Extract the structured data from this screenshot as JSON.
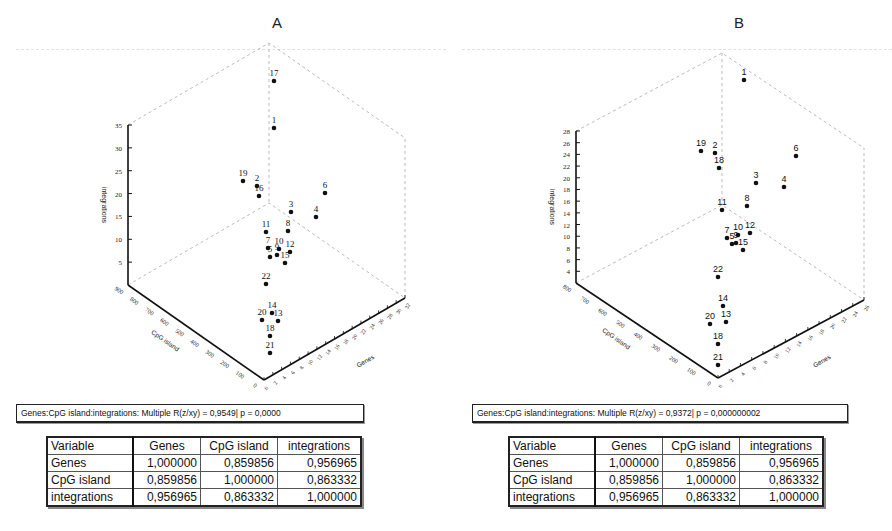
{
  "chart_data": [
    {
      "type": "scatter3d",
      "title": "A",
      "xlabel": "Genes",
      "ylabel": "CpG island",
      "zlabel": "integrations",
      "x_ticks": [
        "0",
        "2",
        "4",
        "6",
        "8",
        "10",
        "12",
        "14",
        "16",
        "18",
        "20",
        "22",
        "24",
        "26",
        "28",
        "30",
        "32"
      ],
      "y_ticks": [
        "0",
        "100",
        "200",
        "300",
        "400",
        "500",
        "600",
        "700",
        "800",
        "900"
      ],
      "z_ticks": [
        "5",
        "10",
        "15",
        "20",
        "25",
        "30",
        "35"
      ],
      "zlim": [
        0,
        35
      ],
      "points": [
        {
          "label": "17",
          "sx": 274,
          "sy": 81
        },
        {
          "label": "1",
          "sx": 274,
          "sy": 128
        },
        {
          "label": "19",
          "sx": 243,
          "sy": 181
        },
        {
          "label": "2",
          "sx": 257,
          "sy": 186
        },
        {
          "label": "16",
          "sx": 259,
          "sy": 196
        },
        {
          "label": "6",
          "sx": 325,
          "sy": 193
        },
        {
          "label": "3",
          "sx": 291,
          "sy": 212
        },
        {
          "label": "4",
          "sx": 316,
          "sy": 217
        },
        {
          "label": "11",
          "sx": 266,
          "sy": 232
        },
        {
          "label": "8",
          "sx": 288,
          "sy": 231
        },
        {
          "label": "7",
          "sx": 268,
          "sy": 248
        },
        {
          "label": "10",
          "sx": 279,
          "sy": 249
        },
        {
          "label": "12",
          "sx": 290,
          "sy": 252
        },
        {
          "label": "5",
          "sx": 270,
          "sy": 257
        },
        {
          "label": "9",
          "sx": 277,
          "sy": 255
        },
        {
          "label": "15",
          "sx": 285,
          "sy": 263
        },
        {
          "label": "22",
          "sx": 266,
          "sy": 284
        },
        {
          "label": "14",
          "sx": 272,
          "sy": 313
        },
        {
          "label": "20",
          "sx": 262,
          "sy": 320
        },
        {
          "label": "13",
          "sx": 278,
          "sy": 321
        },
        {
          "label": "18",
          "sx": 270,
          "sy": 336
        },
        {
          "label": "21",
          "sx": 270,
          "sy": 353
        }
      ],
      "summary": "Genes:CpG island:integrations:  Multiple R(z/xy) = 0,9549| p = 0,0000",
      "multiple_r": 0.9549,
      "p_value": "0,0000",
      "correlation_table": {
        "headers": [
          "Variable",
          "Genes",
          "CpG island",
          "integrations"
        ],
        "rows": [
          [
            "Genes",
            "1,000000",
            "0,859856",
            "0,956965"
          ],
          [
            "CpG island",
            "0,859856",
            "1,000000",
            "0,863332"
          ],
          [
            "integrations",
            "0,956965",
            "0,863332",
            "1,000000"
          ]
        ]
      }
    },
    {
      "type": "scatter3d",
      "title": "B",
      "xlabel": "Genes",
      "ylabel": "CpG island",
      "zlabel": "integrations",
      "x_ticks": [
        "0",
        "2",
        "4",
        "6",
        "8",
        "10",
        "12",
        "14",
        "16",
        "18",
        "20",
        "22",
        "24",
        "26"
      ],
      "y_ticks": [
        "0",
        "100",
        "200",
        "300",
        "400",
        "500",
        "600",
        "700",
        "800"
      ],
      "z_ticks": [
        "4",
        "6",
        "8",
        "10",
        "12",
        "14",
        "16",
        "18",
        "20",
        "22",
        "24",
        "26",
        "28"
      ],
      "zlim": [
        2,
        28
      ],
      "points": [
        {
          "label": "1",
          "sx": 298,
          "sy": 80
        },
        {
          "label": "19",
          "sx": 255,
          "sy": 151
        },
        {
          "label": "2",
          "sx": 269,
          "sy": 153
        },
        {
          "label": "18",
          "sx": 273,
          "sy": 168
        },
        {
          "label": "6",
          "sx": 350,
          "sy": 156
        },
        {
          "label": "3",
          "sx": 310,
          "sy": 183
        },
        {
          "label": "4",
          "sx": 338,
          "sy": 187
        },
        {
          "label": "11",
          "sx": 276,
          "sy": 210
        },
        {
          "label": "8",
          "sx": 301,
          "sy": 206
        },
        {
          "label": "7",
          "sx": 281,
          "sy": 238
        },
        {
          "label": "10",
          "sx": 292,
          "sy": 235
        },
        {
          "label": "12",
          "sx": 304,
          "sy": 233
        },
        {
          "label": "5",
          "sx": 286,
          "sy": 244
        },
        {
          "label": "9",
          "sx": 290,
          "sy": 243
        },
        {
          "label": "15",
          "sx": 297,
          "sy": 250
        },
        {
          "label": "22",
          "sx": 272,
          "sy": 277
        },
        {
          "label": "14",
          "sx": 277,
          "sy": 306
        },
        {
          "label": "20",
          "sx": 264,
          "sy": 324
        },
        {
          "label": "13",
          "sx": 280,
          "sy": 322
        },
        {
          "label": "18b",
          "sx": 272,
          "sy": 344
        },
        {
          "label": "21",
          "sx": 272,
          "sy": 365
        }
      ],
      "summary": "Genes:CpG island:integrations:  Multiple R(z/xy) = 0,9372| p = 0,000000002",
      "multiple_r": 0.9372,
      "p_value": "0,000000002",
      "correlation_table": {
        "headers": [
          "Variable",
          "Genes",
          "CpG island",
          "integrations"
        ],
        "rows": [
          [
            "Genes",
            "1,000000",
            "0,859856",
            "0,956965"
          ],
          [
            "CpG island",
            "0,859856",
            "1,000000",
            "0,863332"
          ],
          [
            "integrations",
            "0,956965",
            "0,863332",
            "1,000000"
          ]
        ]
      }
    }
  ],
  "panels": {
    "a": {
      "title": "A",
      "summary": "Genes:CpG island:integrations:  Multiple R(z/xy) = 0,9549| p = 0,0000",
      "table": {
        "h0": "Variable",
        "h1": "Genes",
        "h2": "CpG island",
        "h3": "integrations",
        "r0": {
          "label": "Genes",
          "v1": "1,000000",
          "v2": "0,859856",
          "v3": "0,956965"
        },
        "r1": {
          "label": "CpG island",
          "v1": "0,859856",
          "v2": "1,000000",
          "v3": "0,863332"
        },
        "r2": {
          "label": "integrations",
          "v1": "0,956965",
          "v2": "0,863332",
          "v3": "1,000000"
        }
      }
    },
    "b": {
      "title": "B",
      "summary": "Genes:CpG island:integrations:  Multiple R(z/xy) = 0,9372| p = 0,000000002",
      "table": {
        "h0": "Variable",
        "h1": "Genes",
        "h2": "CpG island",
        "h3": "integrations",
        "r0": {
          "label": "Genes",
          "v1": "1,000000",
          "v2": "0,859856",
          "v3": "0,956965"
        },
        "r1": {
          "label": "CpG island",
          "v1": "0,859856",
          "v2": "1,000000",
          "v3": "0,863332"
        },
        "r2": {
          "label": "integrations",
          "v1": "0,956965",
          "v2": "0,863332",
          "v3": "1,000000"
        }
      }
    }
  }
}
